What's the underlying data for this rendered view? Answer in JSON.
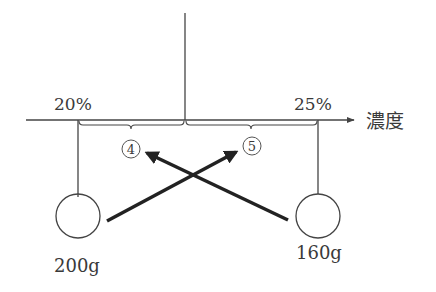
{
  "diagram": {
    "axis_label": "濃度",
    "left": {
      "concentration_label": "20%",
      "mass_label": "200g",
      "segment_ratio_label": "4"
    },
    "right": {
      "concentration_label": "25%",
      "mass_label": "160g",
      "segment_ratio_label": "5"
    },
    "colors": {
      "line": "#444444",
      "arrow": "#222222",
      "text": "#3a3a3a"
    }
  }
}
